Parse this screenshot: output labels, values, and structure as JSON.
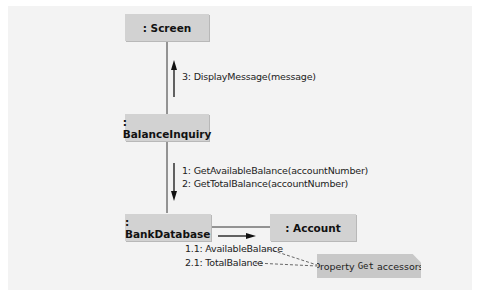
{
  "diagram": {
    "type": "UML communication diagram",
    "objects": {
      "screen": ": Screen",
      "balance_inquiry": ": BalanceInquiry",
      "bank_database": ": BankDatabase",
      "account": ": Account"
    },
    "messages": {
      "m3": "3: DisplayMessage(message)",
      "m1": "1: GetAvailableBalance(accountNumber)",
      "m2": "2: GetTotalBalance(accountNumber)",
      "m11": "1.1: AvailableBalance",
      "m21": "2.1: TotalBalance"
    },
    "note": {
      "prefix": "Property",
      "code": "Get",
      "suffix": "accessors"
    }
  }
}
